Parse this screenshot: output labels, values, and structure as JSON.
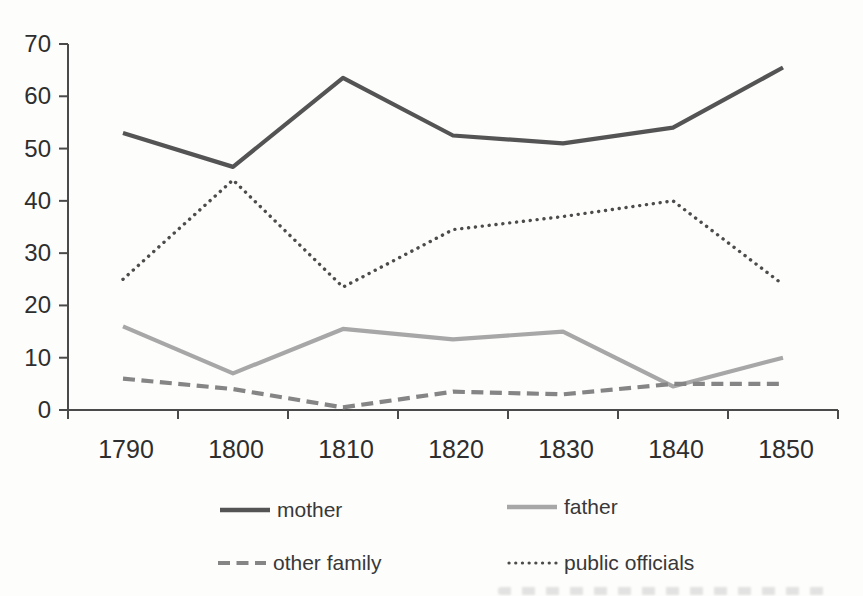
{
  "page": {
    "background_color": "#fdfdfc"
  },
  "chart_data": {
    "type": "line",
    "title": "",
    "xlabel": "",
    "ylabel": "",
    "categories": [
      "1790",
      "1800",
      "1810",
      "1820",
      "1830",
      "1840",
      "1850"
    ],
    "series": [
      {
        "name": "mother",
        "values": [
          53,
          46.5,
          63.5,
          52.5,
          51,
          54,
          65.5
        ],
        "color": "#545454",
        "line_style": "solid"
      },
      {
        "name": "father",
        "values": [
          16,
          7,
          15.5,
          13.5,
          15,
          4.5,
          10
        ],
        "color": "#a7a7a7",
        "line_style": "solid"
      },
      {
        "name": "other family",
        "values": [
          6,
          4,
          0.5,
          3.5,
          3,
          5,
          5
        ],
        "color": "#858585",
        "line_style": "dashed"
      },
      {
        "name": "public officials",
        "values": [
          25,
          44,
          23.5,
          34.5,
          37,
          40,
          24
        ],
        "color": "#4c4c4c",
        "line_style": "dotted"
      }
    ],
    "ylim": [
      0,
      70
    ],
    "ytick_step": 10,
    "grid": false,
    "legend_position": "bottom",
    "axis_color": "#4a4a4a",
    "tick_label_color": "#2e2e2e",
    "legend_text_color": "#383838"
  }
}
